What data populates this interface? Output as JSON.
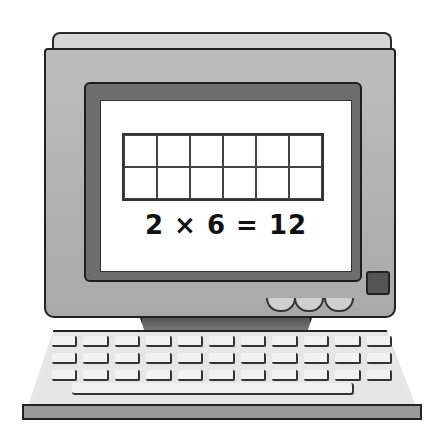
{
  "illustration": {
    "subject": "computer-monitor-with-keyboard",
    "screen": {
      "grid": {
        "rows": 2,
        "columns": 6
      },
      "equation": "2 × 6 = 12"
    },
    "colors": {
      "monitor": "#b3b3b3",
      "bezel": "#6e6e6e",
      "screen": "#ffffff",
      "outline": "#222222"
    }
  }
}
